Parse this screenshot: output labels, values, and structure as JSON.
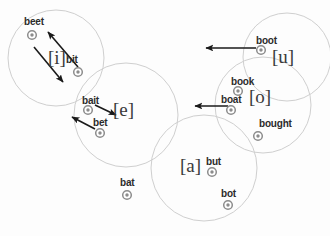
{
  "figure": {
    "background_color": "#fdfdfd",
    "marker_color": "#8c8c8c",
    "circle_color": "#cfcfcf",
    "arrow_color": "#1a1a1a",
    "label_color": "#2b2b2b"
  },
  "chart_data": {
    "type": "scatter",
    "title": "",
    "xlabel": "",
    "ylabel": "",
    "grid": false,
    "legend": null,
    "points": [
      {
        "word": "beet",
        "label_x": 24,
        "label_y": 17,
        "marker_x": 32,
        "marker_y": 35
      },
      {
        "word": "bit",
        "label_x": 66,
        "label_y": 55,
        "marker_x": 78,
        "marker_y": 72
      },
      {
        "word": "bait",
        "label_x": 82,
        "label_y": 96,
        "marker_x": 88,
        "marker_y": 110
      },
      {
        "word": "bet",
        "label_x": 93,
        "label_y": 118,
        "marker_x": 100,
        "marker_y": 133
      },
      {
        "word": "bat",
        "label_x": 120,
        "label_y": 178,
        "marker_x": 127,
        "marker_y": 195
      },
      {
        "word": "boot",
        "label_x": 256,
        "label_y": 36,
        "marker_x": 261,
        "marker_y": 50
      },
      {
        "word": "book",
        "label_x": 231,
        "label_y": 77,
        "marker_x": 238,
        "marker_y": 91
      },
      {
        "word": "boat",
        "label_x": 221,
        "label_y": 95,
        "marker_x": 231,
        "marker_y": 110
      },
      {
        "word": "bought",
        "label_x": 259,
        "label_y": 119,
        "marker_x": 258,
        "marker_y": 136
      },
      {
        "word": "but",
        "label_x": 206,
        "label_y": 157,
        "marker_x": 212,
        "marker_y": 172
      },
      {
        "word": "bot",
        "label_x": 221,
        "label_y": 189,
        "marker_x": 228,
        "marker_y": 205
      }
    ],
    "vowel_categories": [
      {
        "symbol": "[i]",
        "x": 48,
        "y": 48,
        "circle_cx": 56,
        "circle_cy": 58,
        "circle_r": 48
      },
      {
        "symbol": "[e]",
        "x": 113,
        "y": 100,
        "circle_cx": 126,
        "circle_cy": 115,
        "circle_r": 52
      },
      {
        "symbol": "[u]",
        "x": 272,
        "y": 47,
        "circle_cx": 287,
        "circle_cy": 57,
        "circle_r": 44
      },
      {
        "symbol": "[o]",
        "x": 249,
        "y": 87,
        "circle_cx": 263,
        "circle_cy": 105,
        "circle_r": 48
      },
      {
        "symbol": "[a]",
        "x": 180,
        "y": 156,
        "circle_cx": 204,
        "circle_cy": 168,
        "circle_r": 53
      }
    ],
    "arrows": [
      {
        "name": "bit-to-beet",
        "x1": 78,
        "y1": 67,
        "x2": 48,
        "y2": 32
      },
      {
        "name": "beet-area-outward",
        "x1": 34,
        "y1": 47,
        "x2": 63,
        "y2": 82
      },
      {
        "name": "bait-to-e",
        "x1": 95,
        "y1": 105,
        "x2": 116,
        "y2": 115
      },
      {
        "name": "bet-outward-left",
        "x1": 95,
        "y1": 129,
        "x2": 72,
        "y2": 117
      },
      {
        "name": "boot-leftward",
        "x1": 256,
        "y1": 48,
        "x2": 206,
        "y2": 48
      },
      {
        "name": "boat-leftward",
        "x1": 228,
        "y1": 106,
        "x2": 195,
        "y2": 106
      }
    ]
  }
}
